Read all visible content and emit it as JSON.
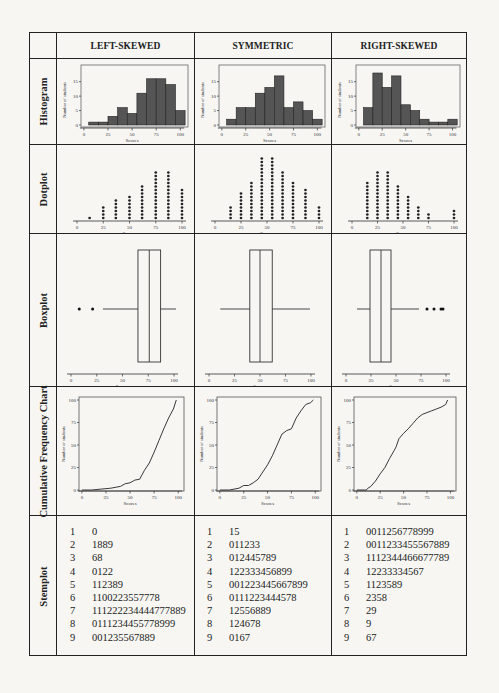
{
  "columns": [
    "LEFT-SKEWED",
    "SYMMETRIC",
    "RIGHT-SKEWED"
  ],
  "rows": [
    "Histogram",
    "Dotplot",
    "Boxplot",
    "Cumulative Frequency Chart",
    "Stemplot"
  ],
  "axis": {
    "x_label": "Scores",
    "y_label": "Number of students",
    "x_ticks": [
      "0",
      "25",
      "50",
      "75",
      "100"
    ],
    "hist_y_ticks": [
      "0",
      "5",
      "10",
      "15"
    ],
    "cfc_y_ticks": [
      "0",
      "25",
      "50",
      "75",
      "100"
    ]
  },
  "chart_data": [
    {
      "type": "bar",
      "title": "Histogram - Left-skewed",
      "xlabel": "Scores",
      "ylabel": "Number of students",
      "bin_edges": [
        5,
        15,
        25,
        35,
        45,
        55,
        65,
        75,
        85,
        95,
        105
      ],
      "values": [
        1,
        1,
        3,
        6,
        4,
        11,
        16,
        16,
        14,
        5
      ],
      "ylim": [
        0,
        18
      ]
    },
    {
      "type": "bar",
      "title": "Histogram - Symmetric",
      "xlabel": "Scores",
      "ylabel": "Number of students",
      "bin_edges": [
        5,
        15,
        25,
        35,
        45,
        55,
        65,
        75,
        85,
        95,
        105
      ],
      "values": [
        2,
        6,
        6,
        11,
        13,
        17,
        6,
        8,
        5,
        2
      ],
      "ylim": [
        0,
        18
      ]
    },
    {
      "type": "bar",
      "title": "Histogram - Right-skewed",
      "xlabel": "Scores",
      "ylabel": "Number of students",
      "bin_edges": [
        5,
        15,
        25,
        35,
        45,
        55,
        65,
        75,
        85,
        95,
        105
      ],
      "values": [
        6,
        18,
        13,
        17,
        7,
        5,
        2,
        1,
        1,
        2
      ],
      "ylim": [
        0,
        18
      ]
    },
    {
      "type": "scatter",
      "title": "Dotplot - Left-skewed",
      "xlabel": "Scores",
      "x": [
        12,
        25,
        37,
        50,
        62,
        75,
        87,
        100
      ],
      "counts": [
        1,
        4,
        6,
        7,
        10,
        14,
        14,
        9
      ]
    },
    {
      "type": "scatter",
      "title": "Dotplot - Symmetric",
      "xlabel": "Scores",
      "x": [
        15,
        25,
        35,
        45,
        55,
        65,
        75,
        87,
        100
      ],
      "counts": [
        4,
        8,
        11,
        18,
        18,
        14,
        11,
        9,
        4
      ]
    },
    {
      "type": "scatter",
      "title": "Dotplot - Right-skewed",
      "xlabel": "Scores",
      "x": [
        15,
        25,
        35,
        45,
        55,
        65,
        75,
        100
      ],
      "counts": [
        11,
        14,
        14,
        10,
        7,
        4,
        2,
        3
      ]
    },
    {
      "type": "box",
      "title": "Boxplot - Left-skewed",
      "xlabel": "Scores",
      "whisker_low": 31,
      "q1": 65,
      "median": 76,
      "q3": 87,
      "whisker_high": 102,
      "outliers": [
        8,
        21
      ]
    },
    {
      "type": "box",
      "title": "Boxplot - Symmetric",
      "xlabel": "Scores",
      "whisker_low": 11,
      "q1": 40,
      "median": 50,
      "q3": 62,
      "whisker_high": 99,
      "outliers": []
    },
    {
      "type": "box",
      "title": "Boxplot - Right-skewed",
      "xlabel": "Scores",
      "whisker_low": 11,
      "q1": 24,
      "median": 35,
      "q3": 45,
      "whisker_high": 73,
      "outliers": [
        81,
        88,
        95,
        97
      ]
    },
    {
      "type": "line",
      "title": "Cumulative Frequency - Left-skewed",
      "xlabel": "Scores",
      "ylabel": "Number of students",
      "ylim": [
        0,
        100
      ],
      "x": [
        0,
        10,
        20,
        30,
        40,
        45,
        50,
        55,
        60,
        65,
        70,
        75,
        80,
        85,
        90,
        95,
        98
      ],
      "values": [
        0,
        0,
        1,
        2,
        4,
        7,
        8,
        11,
        12,
        22,
        30,
        42,
        55,
        68,
        80,
        90,
        100
      ]
    },
    {
      "type": "line",
      "title": "Cumulative Frequency - Symmetric",
      "xlabel": "Scores",
      "ylabel": "Number of students",
      "ylim": [
        0,
        100
      ],
      "x": [
        0,
        10,
        15,
        20,
        25,
        30,
        35,
        40,
        45,
        50,
        55,
        60,
        65,
        70,
        75,
        80,
        85,
        90,
        95,
        98
      ],
      "values": [
        0,
        0,
        1,
        2,
        5,
        5,
        8,
        12,
        20,
        28,
        38,
        50,
        62,
        66,
        68,
        80,
        88,
        95,
        97,
        100
      ]
    },
    {
      "type": "line",
      "title": "Cumulative Frequency - Right-skewed",
      "xlabel": "Scores",
      "ylabel": "Number of students",
      "ylim": [
        0,
        100
      ],
      "x": [
        0,
        10,
        12,
        15,
        20,
        25,
        30,
        35,
        40,
        42,
        45,
        50,
        55,
        60,
        65,
        70,
        75,
        80,
        85,
        90,
        95,
        97
      ],
      "values": [
        0,
        0,
        2,
        4,
        10,
        18,
        25,
        35,
        44,
        48,
        57,
        63,
        68,
        74,
        80,
        84,
        86,
        88,
        90,
        92,
        95,
        100
      ]
    }
  ],
  "stemplots": [
    {
      "rows": [
        [
          "1",
          "0"
        ],
        [
          "2",
          "1889"
        ],
        [
          "3",
          "68"
        ],
        [
          "4",
          "0122"
        ],
        [
          "5",
          "112389"
        ],
        [
          "6",
          "1100223557778"
        ],
        [
          "7",
          "111222234444777889"
        ],
        [
          "8",
          "0111234455778999"
        ],
        [
          "9",
          "001235567889"
        ]
      ]
    },
    {
      "rows": [
        [
          "1",
          "15"
        ],
        [
          "2",
          "011233"
        ],
        [
          "3",
          "012445789"
        ],
        [
          "4",
          "122333456899"
        ],
        [
          "5",
          "001223445667899"
        ],
        [
          "6",
          "0111223444578"
        ],
        [
          "7",
          "12556889"
        ],
        [
          "8",
          "124678"
        ],
        [
          "9",
          "0167"
        ]
      ]
    },
    {
      "rows": [
        [
          "1",
          "0011256778999"
        ],
        [
          "2",
          "0011233455567889"
        ],
        [
          "3",
          "1112344466677789"
        ],
        [
          "4",
          "12233334567"
        ],
        [
          "5",
          "1123589"
        ],
        [
          "6",
          "2358"
        ],
        [
          "7",
          "29"
        ],
        [
          "8",
          "9"
        ],
        [
          "9",
          "67"
        ]
      ]
    }
  ]
}
